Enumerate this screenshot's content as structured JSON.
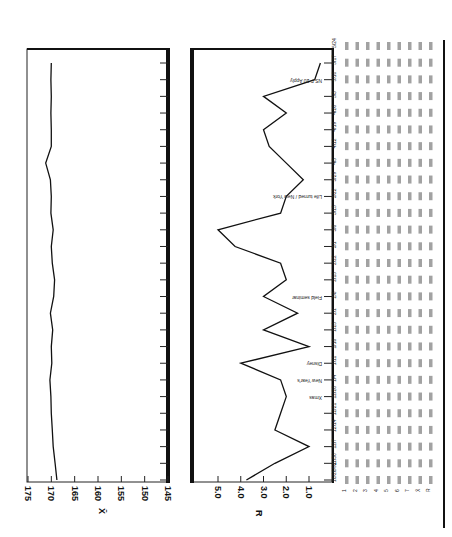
{
  "chart_data": [
    {
      "type": "line",
      "title": "X-bar chart",
      "orientation": "rotated-90",
      "ylabel": "X̄",
      "ylim": [
        145,
        175
      ],
      "ticks": [
        "175",
        "170",
        "165",
        "160",
        "155",
        "150",
        "145"
      ],
      "x_count": 26,
      "values": [
        168.8,
        169.2,
        169.6,
        169.8,
        170.0,
        170.1,
        170.3,
        169.9,
        170.0,
        169.7,
        170.2,
        169.5,
        169.3,
        169.8,
        170.0,
        169.6,
        170.1,
        170.0,
        170.2,
        171.2,
        170.0,
        170.0,
        170.1,
        170.0,
        170.1,
        170.0
      ],
      "grid": false
    },
    {
      "type": "line",
      "title": "R chart",
      "orientation": "rotated-90",
      "ylabel": "R",
      "ylim": [
        0,
        5.5
      ],
      "ticks": [
        "5.0",
        "4.0",
        "3.0",
        "2.0",
        "1.0"
      ],
      "x_count": 26,
      "values": [
        3.75,
        2.5,
        1.0,
        2.5,
        2.25,
        2.0,
        2.25,
        4.0,
        1.0,
        3.0,
        1.5,
        3.0,
        2.0,
        2.25,
        4.25,
        5.0,
        2.25,
        2.0,
        1.25,
        2.0,
        2.75,
        3.0,
        2.0,
        3.0,
        0.75,
        0.5
      ],
      "annotations": [
        {
          "index": 5,
          "text": "Xmas"
        },
        {
          "index": 6,
          "text": "New Year's"
        },
        {
          "index": 7,
          "text": "Disney"
        },
        {
          "index": 11,
          "text": "Field seminar"
        },
        {
          "index": 17,
          "text": "Life turned / New York"
        },
        {
          "index": 24,
          "text": "NS F 20 Apply"
        }
      ],
      "grid": false
    }
  ],
  "axes": {
    "xbar_label": "X̄",
    "r_label": "R",
    "xbar_ticks": [
      "175",
      "170",
      "165",
      "160",
      "155",
      "150",
      "145"
    ],
    "r_ticks": [
      "5.0",
      "4.0",
      "3.0",
      "2.0",
      "1.0"
    ]
  },
  "table": {
    "row_labels": [
      "1",
      "2",
      "3",
      "4",
      "5",
      "6",
      "7",
      "X̄",
      "R"
    ],
    "columns": [
      "10/26/92",
      "11/30",
      "12/7",
      "12/14",
      "12/21",
      "12/28",
      "1/4",
      "1/11",
      "1/18",
      "1/25",
      "2/1",
      "2/8",
      "2/15",
      "2/22",
      "3/1",
      "3/8",
      "3/15",
      "3/22",
      "3/29",
      "4/5",
      "4/12",
      "4/19",
      "4/26",
      "5/3",
      "5/10",
      "5/17",
      "5/24"
    ]
  }
}
